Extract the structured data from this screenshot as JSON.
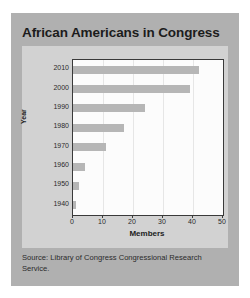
{
  "chart_data": {
    "type": "bar",
    "orientation": "horizontal",
    "title": "African Americans in Congress",
    "xlabel": "Members",
    "ylabel": "Year",
    "categories": [
      "2010",
      "2000",
      "1990",
      "1980",
      "1970",
      "1960",
      "1950",
      "1940"
    ],
    "values": [
      42,
      39,
      24,
      17,
      11,
      4,
      2,
      1
    ],
    "xlim": [
      0,
      50
    ],
    "xticks": [
      0,
      10,
      20,
      30,
      40,
      50
    ],
    "grid": true,
    "legend": null,
    "source": "Source: Library of Congress Congressional Research Service.",
    "bar_color": "#b6b6b6",
    "plot_background": "#fcfcfc",
    "panel_background": "#d2d2d2",
    "card_background": "#b0b0b0",
    "axis_color": "#3a3a3a",
    "text_color": "#1c1c1c"
  }
}
